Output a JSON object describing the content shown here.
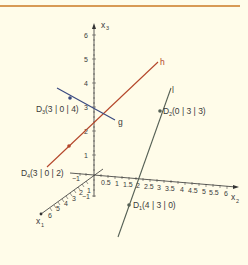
{
  "diagram": {
    "type": "3d-coordinate-system",
    "colors": {
      "background": "#fffce9",
      "top_rule": "#d89a55",
      "axis": "#333333",
      "line_h": "#b4462a",
      "line_g": "#3a4a80",
      "line_l": "#556055",
      "label": "#3a3a3a"
    },
    "axes": {
      "x1": {
        "name": "x",
        "sub": "1",
        "ticks": [
          "1",
          "2",
          "3",
          "4",
          "5",
          "6"
        ]
      },
      "x2": {
        "name": "x",
        "sub": "2",
        "ticks": [
          "0.5",
          "1",
          "1.5",
          "2",
          "2.5",
          "3",
          "3.5",
          "4",
          "4.5",
          "5",
          "5.5",
          "6"
        ],
        "neg": "−1"
      },
      "x3": {
        "name": "x",
        "sub": "3",
        "ticks": [
          "1",
          "2",
          "3",
          "4",
          "5",
          "6"
        ],
        "neg": "−1"
      }
    },
    "lines": {
      "h": {
        "label": "h"
      },
      "g": {
        "label": "g"
      },
      "l": {
        "label": "l"
      }
    },
    "points": {
      "D1": {
        "name": "D",
        "sub": "1",
        "coords": "(4 | 3 | 0)"
      },
      "D2": {
        "name": "D",
        "sub": "2",
        "coords": "(0 | 3 | 3)"
      },
      "D3": {
        "name": "D",
        "sub": "3",
        "coords": "(3 | 0 | 4)"
      },
      "D4": {
        "name": "D",
        "sub": "4",
        "coords": "(3 | 0 | 2)"
      }
    }
  }
}
